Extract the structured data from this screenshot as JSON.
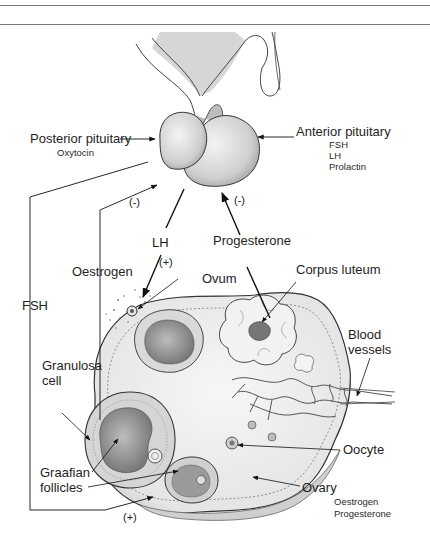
{
  "diagram": {
    "structures": {
      "posterior_pituitary": {
        "label": "Posterior pituitary",
        "hormones": [
          "Oxytocin"
        ]
      },
      "anterior_pituitary": {
        "label": "Anterior pituitary",
        "hormones": [
          "FSH",
          "LH",
          "Prolactin"
        ]
      },
      "ovary": {
        "label": "Ovary",
        "hormones": [
          "Oestrogen",
          "Progesterone"
        ]
      }
    },
    "labels": {
      "ovum": "Ovum",
      "corpus_luteum": "Corpus luteum",
      "blood_vessels_line1": "Blood",
      "blood_vessels_line2": "vessels",
      "granulosa_line1": "Granulosa",
      "granulosa_line2": "cell",
      "graafian_line1": "Graafian",
      "graafian_line2": "follicles",
      "oocyte": "Oocyte"
    },
    "pathways": {
      "fsh": {
        "label": "FSH",
        "effect": "(+)"
      },
      "oestrogen": {
        "label": "Oestrogen",
        "effect": "(-)"
      },
      "lh": {
        "label": "LH",
        "effect": "(+)"
      },
      "progesterone": {
        "label": "Progesterone",
        "effect": "(-)"
      }
    }
  }
}
